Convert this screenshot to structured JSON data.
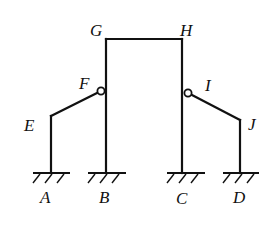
{
  "diagram": {
    "stroke_color": "#111111",
    "background_color": "#ffffff",
    "nodes": {
      "A": {
        "label": "A",
        "x": 51,
        "y": 173,
        "type": "fixed-support"
      },
      "B": {
        "label": "B",
        "x": 106,
        "y": 173,
        "type": "fixed-support"
      },
      "C": {
        "label": "C",
        "x": 182,
        "y": 173,
        "type": "fixed-support"
      },
      "D": {
        "label": "D",
        "x": 240,
        "y": 173,
        "type": "fixed-support"
      },
      "E": {
        "label": "E",
        "x": 51,
        "y": 116,
        "type": "rigid-joint"
      },
      "F": {
        "label": "F",
        "x": 101,
        "y": 91,
        "type": "hinge"
      },
      "G": {
        "label": "G",
        "x": 106,
        "y": 39,
        "type": "rigid-joint"
      },
      "H": {
        "label": "H",
        "x": 182,
        "y": 39,
        "type": "rigid-joint"
      },
      "I": {
        "label": "I",
        "x": 188,
        "y": 93,
        "type": "hinge"
      },
      "J": {
        "label": "J",
        "x": 240,
        "y": 120,
        "type": "rigid-joint"
      }
    },
    "members": [
      {
        "from": "A",
        "to": "E"
      },
      {
        "from": "E",
        "to": "F"
      },
      {
        "from": "B",
        "to": "G"
      },
      {
        "from": "G",
        "to": "H"
      },
      {
        "from": "H",
        "to": "C"
      },
      {
        "from": "I",
        "to": "J"
      },
      {
        "from": "J",
        "to": "D"
      }
    ],
    "labels": {
      "A": "A",
      "B": "B",
      "C": "C",
      "D": "D",
      "E": "E",
      "F": "F",
      "G": "G",
      "H": "H",
      "I": "I",
      "J": "J"
    }
  }
}
